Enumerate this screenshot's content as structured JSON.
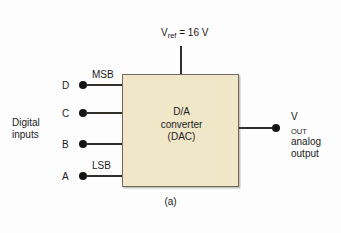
{
  "figure": {
    "caption": "(a)",
    "background_color": "#fdfdfd"
  },
  "block": {
    "name": "D/A converter",
    "fill_color": "#f0e7c9",
    "border_color": "#6f6a5d",
    "lines": [
      "D/A",
      "converter",
      "(DAC)"
    ]
  },
  "supply": {
    "label_v": "V",
    "label_sub": "ref",
    "label_rest": " = 16 V",
    "full_label": "Vref = 16 V",
    "value": "16 V"
  },
  "inputs": {
    "group_label_lines": [
      "Digital",
      "inputs"
    ],
    "group_label": "Digital inputs",
    "pins": [
      {
        "letter": "D",
        "tag": "MSB"
      },
      {
        "letter": "C",
        "tag": ""
      },
      {
        "letter": "B",
        "tag": ""
      },
      {
        "letter": "A",
        "tag": "LSB"
      }
    ],
    "msb_label": "MSB",
    "lsb_label": "LSB"
  },
  "output": {
    "label_v": "V",
    "label_sub": "OUT",
    "lines": [
      "analog",
      "output"
    ],
    "full_label": "VOUT analog output"
  },
  "colors": {
    "wire": "#33302c",
    "dot": "#151515",
    "text": "#1b1b1b"
  }
}
